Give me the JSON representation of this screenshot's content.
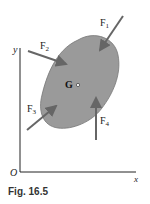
{
  "figure": {
    "caption": "Fig. 16.5",
    "axes": {
      "y_label": "y",
      "x_label": "x",
      "origin_label": "O"
    },
    "center_label": "G",
    "forces": [
      {
        "label": "F",
        "sub": "1"
      },
      {
        "label": "F",
        "sub": "2"
      },
      {
        "label": "F",
        "sub": "3"
      },
      {
        "label": "F",
        "sub": "4"
      }
    ],
    "colors": {
      "body": "#9a9a9a",
      "arrow": "#666666",
      "axis": "#222222"
    }
  }
}
